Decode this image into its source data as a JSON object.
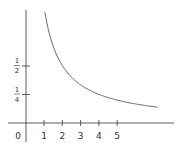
{
  "chart_data": {
    "type": "line",
    "title": "",
    "function": "y = 1/x",
    "xlabel": "",
    "ylabel": "",
    "x_ticks": [
      "1",
      "2",
      "3",
      "4",
      "5"
    ],
    "y_ticks": [
      {
        "num": "1",
        "den": "2",
        "value": 0.5
      },
      {
        "num": "1",
        "den": "4",
        "value": 0.25
      }
    ],
    "origin_label": "0",
    "series": [
      {
        "name": "1/x",
        "x": [
          0.85,
          1,
          1.5,
          2,
          2.5,
          3,
          3.5,
          4,
          4.5,
          5,
          5.5,
          6,
          6.5,
          7.2
        ],
        "values": [
          1.18,
          1.0,
          0.667,
          0.5,
          0.4,
          0.333,
          0.286,
          0.25,
          0.222,
          0.2,
          0.182,
          0.167,
          0.154,
          0.139
        ]
      }
    ],
    "xlim": [
      -0.5,
      8.5
    ],
    "ylim": [
      -0.2,
      1.1
    ],
    "grid": false,
    "colors": {
      "curve": "#555555",
      "axes": "#333333"
    }
  }
}
